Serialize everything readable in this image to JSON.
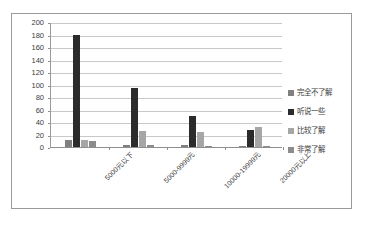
{
  "chart_data": {
    "type": "bar",
    "title": "",
    "xlabel": "",
    "ylabel": "",
    "ylim": [
      0,
      200
    ],
    "ytick_step": 20,
    "yticks": [
      "200",
      "180",
      "160",
      "140",
      "120",
      "100",
      "80",
      "60",
      "40",
      "20",
      "0"
    ],
    "grid": true,
    "legend_position": "right",
    "categories": [
      "5000元以下",
      "5000-9999元",
      "10000-19999元",
      "20000元以上"
    ],
    "series": [
      {
        "name": "完全不了解",
        "color": "#808080",
        "values": [
          12,
          4,
          3,
          2
        ]
      },
      {
        "name": "听说一些",
        "color": "#2b2b2b",
        "values": [
          179,
          95,
          50,
          27
        ]
      },
      {
        "name": "比较了解",
        "color": "#a6a6a6",
        "values": [
          12,
          25,
          24,
          32
        ]
      },
      {
        "name": "非常了解",
        "color": "#8c8c8c",
        "values": [
          10,
          3,
          2,
          2
        ]
      }
    ]
  },
  "legend": {
    "items": [
      {
        "label": "完全不了解"
      },
      {
        "label": "听说一些"
      },
      {
        "label": "比较了解"
      },
      {
        "label": "非常了解"
      }
    ]
  },
  "colors": {
    "border": "#9a9a9a",
    "gridline": "#c9c9c9",
    "axis": "#8f8f8f",
    "text": "#3d3d3d",
    "background": "#ffffff"
  }
}
